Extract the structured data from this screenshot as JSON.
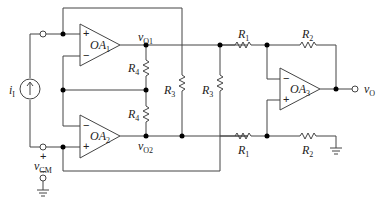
{
  "diagram": {
    "type": "instrumentation-amplifier-circuit",
    "opamps": [
      {
        "id": "OA1",
        "label": "OA",
        "sub": "1"
      },
      {
        "id": "OA2",
        "label": "OA",
        "sub": "2"
      },
      {
        "id": "OA3",
        "label": "OA",
        "sub": "3"
      }
    ],
    "resistors": {
      "r1_top": {
        "label": "R",
        "sub": "1"
      },
      "r1_bot": {
        "label": "R",
        "sub": "1"
      },
      "r2_top": {
        "label": "R",
        "sub": "2"
      },
      "r2_bot": {
        "label": "R",
        "sub": "2"
      },
      "r3_left": {
        "label": "R",
        "sub": "3"
      },
      "r3_right": {
        "label": "R",
        "sub": "3"
      },
      "r4_top": {
        "label": "R",
        "sub": "4"
      },
      "r4_bot": {
        "label": "R",
        "sub": "4"
      }
    },
    "nodes": {
      "vo1": {
        "label": "v",
        "sub": "O1"
      },
      "vo2": {
        "label": "v",
        "sub": "O2"
      },
      "vo": {
        "label": "v",
        "sub": "O"
      },
      "vcm": {
        "label": "v",
        "sub": "CM"
      },
      "ii": {
        "label": "i",
        "sub": "I"
      }
    },
    "signs": {
      "plus": "+",
      "minus": "−"
    }
  }
}
